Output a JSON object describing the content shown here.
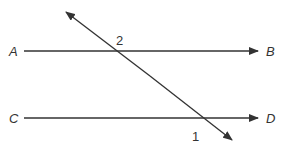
{
  "diagram": {
    "type": "parallel lines cut by a transversal",
    "lines": [
      {
        "id": "AB",
        "start_label": "A",
        "end_label": "B"
      },
      {
        "id": "CD",
        "start_label": "C",
        "end_label": "D"
      }
    ],
    "transversal": {
      "id": "transversal"
    },
    "angles": [
      {
        "label": "2",
        "position": "above line AB, right of transversal"
      },
      {
        "label": "1",
        "position": "below line CD, left of transversal"
      }
    ],
    "colors": {
      "stroke": "#333333",
      "background": "#ffffff"
    }
  }
}
